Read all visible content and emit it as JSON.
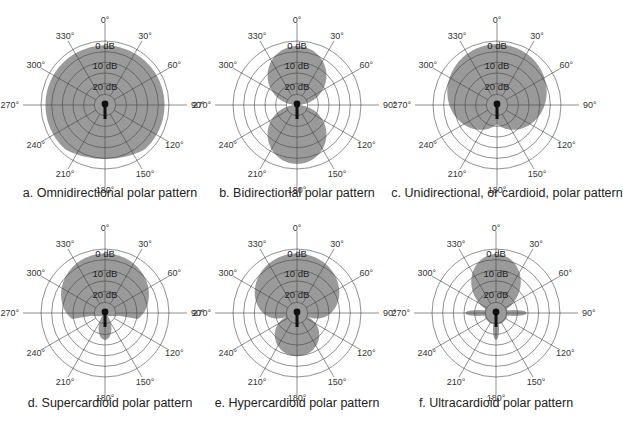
{
  "figure": {
    "panels": [
      {
        "id": "a",
        "caption": "a. Omnidirectional polar pattern",
        "pattern": "omni",
        "cx": 105,
        "cy": 105,
        "caption_x": 110,
        "caption_y": 194
      },
      {
        "id": "b",
        "caption": "b. Bidirectional polar pattern",
        "pattern": "bidirectional",
        "cx": 297,
        "cy": 105,
        "caption_x": 297,
        "caption_y": 194
      },
      {
        "id": "c",
        "caption": "c. Unidirectional, or cardioid, polar pattern",
        "pattern": "cardioid",
        "cx": 497,
        "cy": 105,
        "caption_x": 507,
        "caption_y": 194
      },
      {
        "id": "d",
        "caption": "d. Supercardioid polar pattern",
        "pattern": "supercardioid",
        "cx": 105,
        "cy": 313,
        "caption_x": 110,
        "caption_y": 404
      },
      {
        "id": "e",
        "caption": "e. Hypercardioid polar pattern",
        "pattern": "hypercardioid",
        "cx": 297,
        "cy": 313,
        "caption_x": 297,
        "caption_y": 404
      },
      {
        "id": "f",
        "caption": "f. Ultracardioid polar pattern",
        "pattern": "ultracardioid",
        "cx": 496,
        "cy": 313,
        "caption_x": 496,
        "caption_y": 404
      }
    ],
    "angle_labels": [
      "0°",
      "30°",
      "60°",
      "90°",
      "120°",
      "150°",
      "180°",
      "210°",
      "240°",
      "270°",
      "300°",
      "330°"
    ],
    "db_labels": [
      "0 dB",
      "10 dB",
      "20 dB"
    ],
    "ring_count": 6,
    "colors": {
      "fill": "#9a9a9a",
      "grid": "#444444",
      "ring_outline": "#666666",
      "mic": "#111111",
      "background": "#ffffff"
    }
  }
}
